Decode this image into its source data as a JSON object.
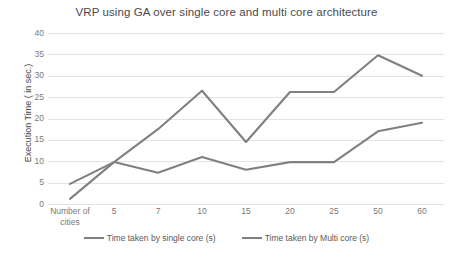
{
  "chart_data": {
    "type": "line",
    "title": "VRP using GA over single core and multi core architecture",
    "xlabel": "",
    "ylabel": "Execution Time ( in sec.)",
    "categories": [
      "Number of cities",
      "5",
      "7",
      "10",
      "15",
      "20",
      "25",
      "50",
      "60"
    ],
    "series": [
      {
        "name": "Time taken by single core (s)",
        "color": "#808080",
        "values": [
          4.7,
          9.8,
          17.5,
          26.5,
          14.5,
          26.2,
          26.2,
          34.8,
          30.0
        ]
      },
      {
        "name": "Time taken by Multi core (s)",
        "color": "#808080",
        "values": [
          1.2,
          9.8,
          7.3,
          11.0,
          8.0,
          9.8,
          9.8,
          17.0,
          19.0
        ]
      }
    ],
    "ylim": [
      0,
      40
    ],
    "yticks": [
      0,
      5,
      10,
      15,
      20,
      25,
      30,
      35,
      40
    ],
    "grid": true,
    "legend_position": "bottom"
  },
  "legend": {
    "entries": [
      {
        "label": "Time taken by single core (s)"
      },
      {
        "label": "Time taken by Multi core (s)"
      }
    ]
  },
  "colors": {
    "series_line": "#808080",
    "gridline": "#e4e4e4",
    "tick_text": "#7a7a7a",
    "title_text": "#4a4a4a",
    "background": "#ffffff"
  }
}
